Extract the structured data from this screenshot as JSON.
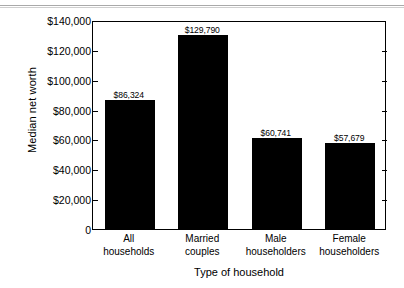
{
  "chart_data": {
    "type": "bar",
    "title": "",
    "xlabel": "Type of household",
    "ylabel": "Median net worth",
    "categories": [
      "All households",
      "Married couples",
      "Male householders",
      "Female householders"
    ],
    "category_lines": [
      [
        "All",
        "households"
      ],
      [
        "Married",
        "couples"
      ],
      [
        "Male",
        "householders"
      ],
      [
        "Female",
        "householders"
      ]
    ],
    "values": [
      86324,
      129790,
      60741,
      57679
    ],
    "value_labels": [
      "$86,324",
      "$129,790",
      "$60,741",
      "$57,679"
    ],
    "ylim": [
      0,
      140000
    ],
    "ytick_values": [
      0,
      20000,
      40000,
      60000,
      80000,
      100000,
      120000,
      140000
    ],
    "ytick_labels": [
      "0",
      "$20,000",
      "$40,000",
      "$60,000",
      "$80,000",
      "$100,000",
      "$120,000",
      "$140,000"
    ],
    "grid": false,
    "legend": "none",
    "bar_color": "#000000",
    "background_color": "#ffffff",
    "frame_color": "#000000"
  }
}
